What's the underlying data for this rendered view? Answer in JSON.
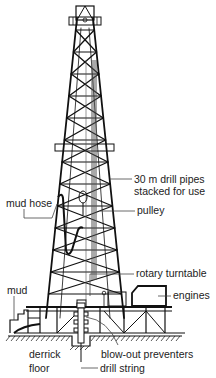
{
  "diagram": {
    "labels": {
      "drill_pipes_line1": "30 m drill pipes",
      "drill_pipes_line2": "stacked for use",
      "pulley": "pulley",
      "mud_hose": "mud hose",
      "rotary_turntable": "rotary turntable",
      "engines": "engines",
      "mud": "mud",
      "derrick_floor_line1": "derrick",
      "derrick_floor_line2": "floor",
      "blow_out_preventers": "blow-out preventers",
      "drill_string": "drill string"
    },
    "colors": {
      "ink": "#111111",
      "background": "#ffffff",
      "leader": "#444444"
    }
  }
}
